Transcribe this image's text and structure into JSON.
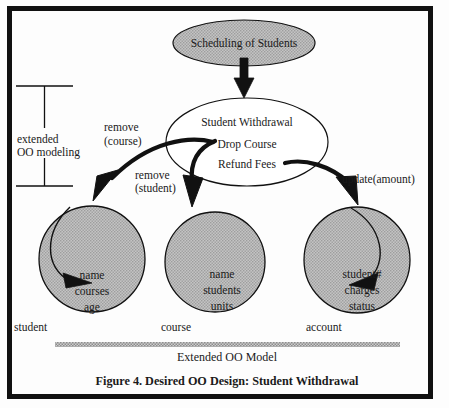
{
  "figure": {
    "caption": "Figure 4. Desired OO Design: Student Withdrawal",
    "border_color": "#111111",
    "background": "#fdfdfd"
  },
  "diagram": {
    "type": "object-oriented-design-diagram",
    "shaded_fill": "#b8b8b8",
    "white_fill": "#ffffff",
    "stroke": "#111111"
  },
  "top_ellipse": {
    "label": "Scheduling of Students",
    "fill": "#b8b8b8",
    "shape": "ellipse"
  },
  "middle_ellipse": {
    "title": "Student Withdrawal",
    "operations": [
      "Drop Course",
      "Refund Fees"
    ],
    "fill": "#ffffff",
    "shape": "ellipse"
  },
  "classes": [
    {
      "name": "student",
      "attributes": [
        "name",
        "courses",
        "age"
      ],
      "fill": "#b8b8b8"
    },
    {
      "name": "course",
      "attributes": [
        "name",
        "students",
        "units"
      ],
      "fill": "#b8b8b8"
    },
    {
      "name": "account",
      "attributes": [
        "student#",
        "charges",
        "status"
      ],
      "fill": "#b8b8b8"
    }
  ],
  "edge_labels": {
    "remove_course_line1": "remove",
    "remove_course_line2": "(course)",
    "remove_student_line1": "remove",
    "remove_student_line2": "(student)",
    "update_amount": "update(amount)"
  },
  "bracket": {
    "line1": "extended",
    "line2": "OO modeling"
  },
  "model_bar": {
    "caption": "Extended OO Model",
    "bar_fill": "#9a9a9a"
  }
}
